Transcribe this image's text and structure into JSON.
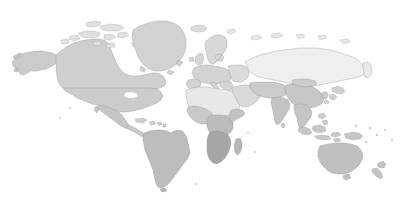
{
  "map": {
    "title": "World Map",
    "type": "world-choropleth",
    "projection": "equirectangular",
    "background_color": "#ffffff",
    "ocean_color": "#ffffff",
    "border_color": "#8e8e8e",
    "has_antarctica": false,
    "has_labels": false,
    "has_graticule": false,
    "width": 411,
    "height": 215,
    "shade_legend": [
      {
        "name": "very-light",
        "color": "#f0f0f0"
      },
      {
        "name": "light",
        "color": "#e4e4e4"
      },
      {
        "name": "medium-light",
        "color": "#d6d6d6"
      },
      {
        "name": "medium",
        "color": "#c4c4c4"
      },
      {
        "name": "medium-dark",
        "color": "#b3b3b3"
      },
      {
        "name": "dark",
        "color": "#a2a2a2"
      }
    ],
    "regions": [
      {
        "name": "greenland",
        "shade": "#d2d2d2"
      },
      {
        "name": "canada",
        "shade": "#cfcfcf"
      },
      {
        "name": "alaska",
        "shade": "#cbcbcb"
      },
      {
        "name": "united-states",
        "shade": "#cccccc"
      },
      {
        "name": "mexico",
        "shade": "#c6c6c6"
      },
      {
        "name": "central-america",
        "shade": "#c9c9c9"
      },
      {
        "name": "caribbean",
        "shade": "#cdcdcd"
      },
      {
        "name": "south-america",
        "shade": "#bdbdbd"
      },
      {
        "name": "iceland",
        "shade": "#dcdcdc"
      },
      {
        "name": "scandinavia",
        "shade": "#d8d8d8"
      },
      {
        "name": "british-isles",
        "shade": "#d5d5d5"
      },
      {
        "name": "western-europe",
        "shade": "#d4d4d4"
      },
      {
        "name": "eastern-europe",
        "shade": "#dadada"
      },
      {
        "name": "russia",
        "shade": "#efefef"
      },
      {
        "name": "north-africa",
        "shade": "#e8e8e8"
      },
      {
        "name": "west-africa",
        "shade": "#c9c9c9"
      },
      {
        "name": "central-africa",
        "shade": "#bcbcbc"
      },
      {
        "name": "east-africa",
        "shade": "#c2c2c2"
      },
      {
        "name": "southern-africa",
        "shade": "#a6a6a6"
      },
      {
        "name": "madagascar",
        "shade": "#b8b8b8"
      },
      {
        "name": "middle-east",
        "shade": "#d9d9d9"
      },
      {
        "name": "central-asia",
        "shade": "#cbcbcb"
      },
      {
        "name": "india",
        "shade": "#c3c3c3"
      },
      {
        "name": "china",
        "shade": "#c7c7c7"
      },
      {
        "name": "mongolia",
        "shade": "#cdcdcd"
      },
      {
        "name": "southeast-asia",
        "shade": "#c5c5c5"
      },
      {
        "name": "japan",
        "shade": "#d0d0d0"
      },
      {
        "name": "korea",
        "shade": "#cccccc"
      },
      {
        "name": "indonesia",
        "shade": "#c8c8c8"
      },
      {
        "name": "philippines",
        "shade": "#cdcdcd"
      },
      {
        "name": "papua-new-guinea",
        "shade": "#c6c6c6"
      },
      {
        "name": "australia",
        "shade": "#c0c0c0"
      },
      {
        "name": "new-zealand",
        "shade": "#c4c4c4"
      },
      {
        "name": "arctic-islands",
        "shade": "#e0e0e0"
      }
    ]
  }
}
